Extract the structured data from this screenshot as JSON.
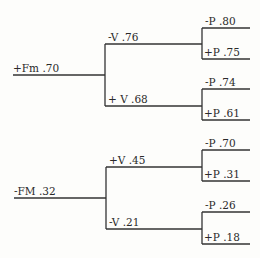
{
  "diagram": {
    "type": "probability-tree",
    "root": [
      {
        "label": "+Fm .70",
        "children": [
          {
            "label": "-V .76",
            "children": [
              {
                "label": "-P .80"
              },
              {
                "label": "+P .75"
              }
            ]
          },
          {
            "label": "+ V .68",
            "children": [
              {
                "label": "-P .74"
              },
              {
                "label": "+P .61"
              }
            ]
          }
        ]
      },
      {
        "label": "-FM .32",
        "children": [
          {
            "label": "+V .45",
            "children": [
              {
                "label": "-P .70"
              },
              {
                "label": "+P .31"
              }
            ]
          },
          {
            "label": "-V .21",
            "children": [
              {
                "label": "-P .26"
              },
              {
                "label": "+P .18"
              }
            ]
          }
        ]
      }
    ]
  }
}
